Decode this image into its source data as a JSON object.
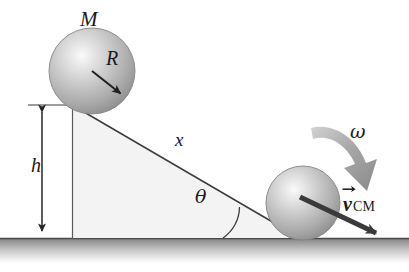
{
  "figure": {
    "labels": {
      "mass": "M",
      "radius": "R",
      "distance_along_incline": "x",
      "height": "h",
      "incline_angle": "θ",
      "angular_velocity": "ω",
      "velocity_symbol": "v",
      "velocity_subscript": "CM"
    },
    "colors": {
      "sphere_light": "#f0f0f0",
      "sphere_mid": "#b9b9b9",
      "sphere_dark": "#8e8e8e",
      "sphere_edge": "#7d7d7d",
      "incline_fill": "#f2f2f2",
      "incline_stroke": "#3a3a3a",
      "ground_top": "#7f7f7f",
      "ground_bottom": "#ffffff",
      "arrow_dark": "#2b2b2b",
      "arrow_gray": "#9a9a9a",
      "text": "#1a1a1a"
    },
    "geometry": {
      "upper_sphere": {
        "cx": 92,
        "cy": 71,
        "r": 43
      },
      "lower_sphere": {
        "cx": 303,
        "cy": 203,
        "r": 37
      },
      "incline_apex": {
        "x": 72,
        "y": 105
      },
      "incline_base_left": {
        "x": 72,
        "y": 238
      },
      "incline_base_right": {
        "x": 300,
        "y": 238
      },
      "ground_line_y": 238,
      "height_arrow_x": 42,
      "angle_value_degrees": 30
    }
  }
}
